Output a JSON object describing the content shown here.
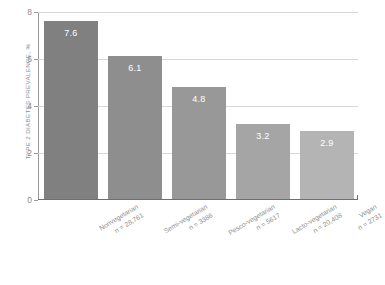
{
  "chart_data": {
    "type": "bar",
    "title": "",
    "xlabel": "",
    "ylabel": "TYPE 2 DIABETES PREVALENCE, %",
    "ylim": [
      0,
      8
    ],
    "yticks": [
      "0",
      "2",
      "4",
      "6",
      "8"
    ],
    "grid": true,
    "legend": "none",
    "categories": [
      "Nonvegetarian",
      "Semi-vegetarian",
      "Pesco-vegetarian",
      "Lacto-vegetarian",
      "Vegan"
    ],
    "category_counts": [
      "n = 28,761",
      "n = 3386",
      "n = 5617",
      "n = 20,408",
      "n = 2731"
    ],
    "values": [
      7.6,
      6.1,
      4.8,
      3.2,
      2.9
    ],
    "value_labels": [
      "7.6",
      "6.1",
      "4.8",
      "3.2",
      "2.9"
    ],
    "bar_colors": [
      "#808080",
      "#8e8e8e",
      "#989898",
      "#a5a5a5",
      "#b4b4b4"
    ]
  },
  "footer": {
    "note": ""
  }
}
